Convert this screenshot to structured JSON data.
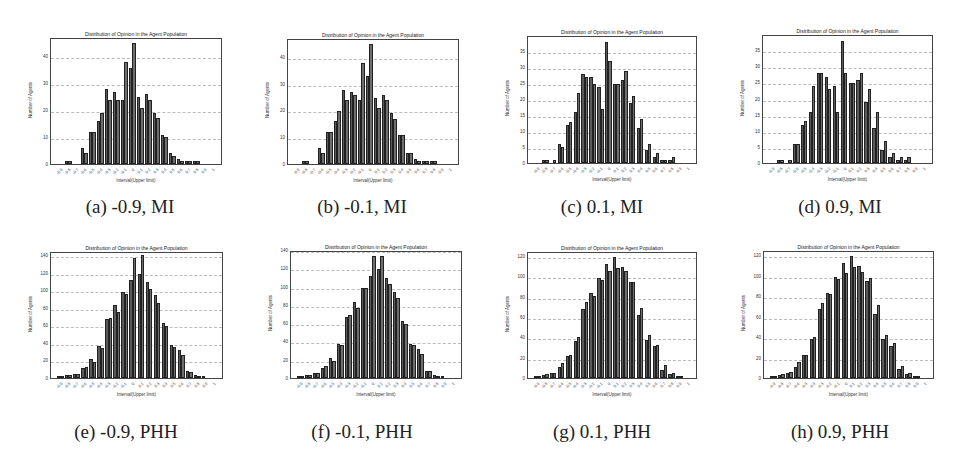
{
  "figure": {
    "captions": [
      "(a) -0.9, MI",
      "(b) -0.1, MI",
      "(c) 0.1, MI",
      "(d) 0.9, MI",
      "(e) -0.9, PHH",
      "(f) -0.1, PHH",
      "(g) 0.1, PHH",
      "(h) 0.9, PHH"
    ]
  },
  "chart_data": [
    {
      "id": "a",
      "type": "bar",
      "caption": "(a) -0.9, MI",
      "title": "Distribution of Opinion in the Agent Population",
      "xlabel": "Interval(Upper limit)",
      "ylabel": "Number of Agents",
      "ylim": [
        0,
        47
      ],
      "yticks": [
        0,
        10,
        20,
        30,
        40
      ],
      "grid": true,
      "categories": [
        "-0.9",
        "-0.8",
        "-0.7",
        "-0.6",
        "-0.5",
        "-0.4",
        "-0.3",
        "-0.2",
        "-0.1",
        "0",
        "0.1",
        "0.2",
        "0.3",
        "0.4",
        "0.5",
        "0.6",
        "0.7",
        "0.8",
        "0.9",
        "1"
      ],
      "series": [
        {
          "name": "series 1",
          "values": [
            0,
            1,
            0,
            6,
            12,
            16,
            28,
            27,
            24,
            36,
            25,
            26,
            19,
            11,
            4,
            2,
            1,
            1,
            0,
            0
          ]
        },
        {
          "name": "series 2",
          "values": [
            0,
            1,
            0,
            4,
            12,
            19,
            24,
            24,
            38,
            45,
            21,
            24,
            17,
            10,
            3,
            1,
            1,
            1,
            0,
            0
          ]
        }
      ]
    },
    {
      "id": "b",
      "type": "bar",
      "caption": "(b) -0.1, MI",
      "title": "Distribution of Opinion in the Agent Population",
      "xlabel": "Interval(Upper limit)",
      "ylabel": "Number of Agents",
      "ylim": [
        0,
        47
      ],
      "yticks": [
        0,
        10,
        20,
        30,
        40
      ],
      "grid": true,
      "categories": [
        "-0.9",
        "-0.8",
        "-0.7",
        "-0.6",
        "-0.5",
        "-0.4",
        "-0.3",
        "-0.2",
        "-0.1",
        "0",
        "0.1",
        "0.2",
        "0.3",
        "0.4",
        "0.5",
        "0.6",
        "0.7",
        "0.8",
        "0.9",
        "1"
      ],
      "series": [
        {
          "name": "series 1",
          "values": [
            0,
            1,
            0,
            6,
            12,
            16,
            28,
            27,
            24,
            33,
            25,
            26,
            19,
            11,
            4,
            2,
            1,
            1,
            0,
            0
          ]
        },
        {
          "name": "series 2",
          "values": [
            0,
            1,
            0,
            4,
            12,
            20,
            24,
            26,
            38,
            45,
            21,
            24,
            17,
            11,
            4,
            1,
            1,
            1,
            0,
            0
          ]
        }
      ]
    },
    {
      "id": "c",
      "type": "bar",
      "caption": "(c) 0.1, MI",
      "title": "Distribution of Opinion in the Agent Population",
      "xlabel": "Interval(Upper limit)",
      "ylabel": "Number of Agents",
      "ylim": [
        0,
        40
      ],
      "yticks": [
        0,
        5,
        10,
        15,
        20,
        25,
        30,
        35
      ],
      "grid": true,
      "categories": [
        "-0.9",
        "-0.8",
        "-0.7",
        "-0.6",
        "-0.5",
        "-0.4",
        "-0.3",
        "-0.2",
        "-0.1",
        "0",
        "0.1",
        "0.2",
        "0.3",
        "0.4",
        "0.5",
        "0.6",
        "0.7",
        "0.8",
        "0.9",
        "1"
      ],
      "series": [
        {
          "name": "series 1",
          "values": [
            0,
            1,
            0,
            6,
            12,
            16,
            28,
            27,
            24,
            38,
            25,
            26,
            19,
            11,
            4,
            2,
            1,
            1,
            0,
            0
          ]
        },
        {
          "name": "series 2",
          "values": [
            0,
            1,
            1,
            5,
            13,
            22,
            27,
            25,
            17,
            32,
            25,
            29,
            21,
            14,
            6,
            3,
            1,
            2,
            0,
            0
          ]
        }
      ]
    },
    {
      "id": "d",
      "type": "bar",
      "caption": "(d) 0.9, MI",
      "title": "Distribution of Opinion in the Agent Population",
      "xlabel": "Interval(Upper limit)",
      "ylabel": "Number of Agents",
      "ylim": [
        0,
        40
      ],
      "yticks": [
        0,
        5,
        10,
        15,
        20,
        25,
        30,
        35
      ],
      "grid": true,
      "categories": [
        "-0.9",
        "-0.8",
        "-0.7",
        "-0.6",
        "-0.5",
        "-0.4",
        "-0.3",
        "-0.2",
        "-0.1",
        "0",
        "0.1",
        "0.2",
        "0.3",
        "0.4",
        "0.5",
        "0.6",
        "0.7",
        "0.8",
        "0.9",
        "1"
      ],
      "series": [
        {
          "name": "series 1",
          "values": [
            0,
            1,
            0,
            6,
            12,
            16,
            28,
            27,
            24,
            38,
            25,
            26,
            19,
            11,
            4,
            2,
            1,
            1,
            0,
            0
          ]
        },
        {
          "name": "series 2",
          "values": [
            0,
            1,
            1,
            6,
            13,
            24,
            28,
            23,
            16,
            28,
            25,
            28,
            23,
            16,
            7,
            3,
            2,
            2,
            0,
            0
          ]
        }
      ]
    },
    {
      "id": "e",
      "type": "bar",
      "caption": "(e) -0.9, PHH",
      "title": "Distribution of Opinion in the Agent Population",
      "xlabel": "Interval(Upper limit)",
      "ylabel": "Number of Agents",
      "ylim": [
        0,
        145
      ],
      "yticks": [
        0,
        20,
        40,
        60,
        80,
        100,
        120,
        140
      ],
      "grid": true,
      "categories": [
        "-0.9",
        "-0.8",
        "-0.7",
        "-0.6",
        "-0.5",
        "-0.4",
        "-0.3",
        "-0.2",
        "-0.1",
        "0",
        "0.1",
        "0.2",
        "0.3",
        "0.4",
        "0.5",
        "0.6",
        "0.7",
        "0.8",
        "0.9",
        "1"
      ],
      "series": [
        {
          "name": "series 1",
          "values": [
            1,
            3,
            5,
            11,
            22,
            37,
            68,
            84,
            99,
            113,
            120,
            110,
            95,
            63,
            38,
            32,
            8,
            3,
            1,
            0
          ]
        },
        {
          "name": "series 2",
          "values": [
            1,
            3,
            5,
            13,
            19,
            35,
            69,
            76,
            97,
            138,
            141,
            103,
            86,
            60,
            36,
            26,
            7,
            2,
            0,
            0
          ]
        }
      ]
    },
    {
      "id": "f",
      "type": "bar",
      "caption": "(f) -0.1, PHH",
      "title": "Distribution of Opinion in the Agent Population",
      "xlabel": "Interval(Upper limit)",
      "ylabel": "Number of Agents",
      "ylim": [
        0,
        140
      ],
      "yticks": [
        0,
        20,
        40,
        60,
        80,
        100,
        120,
        140
      ],
      "grid": true,
      "categories": [
        "-0.9",
        "-0.8",
        "-0.7",
        "-0.6",
        "-0.5",
        "-0.4",
        "-0.3",
        "-0.2",
        "-0.1",
        "0",
        "0.1",
        "0.2",
        "0.3",
        "0.4",
        "0.5",
        "0.6",
        "0.7",
        "0.8",
        "0.9",
        "1"
      ],
      "series": [
        {
          "name": "series 1",
          "values": [
            1,
            3,
            5,
            11,
            22,
            37,
            67,
            84,
            99,
            113,
            120,
            110,
            95,
            63,
            38,
            32,
            8,
            3,
            1,
            0
          ]
        },
        {
          "name": "series 2",
          "values": [
            1,
            3,
            5,
            13,
            19,
            36,
            70,
            77,
            99,
            134,
            135,
            104,
            88,
            60,
            36,
            27,
            8,
            2,
            0,
            0
          ]
        }
      ]
    },
    {
      "id": "g",
      "type": "bar",
      "caption": "(g) 0.1, PHH",
      "title": "Distribution of Opinion in the Agent Population",
      "xlabel": "Interval(Upper limit)",
      "ylabel": "Number of Agents",
      "ylim": [
        0,
        125
      ],
      "yticks": [
        0,
        20,
        40,
        60,
        80,
        100,
        120
      ],
      "grid": true,
      "categories": [
        "-0.9",
        "-0.8",
        "-0.7",
        "-0.6",
        "-0.5",
        "-0.4",
        "-0.3",
        "-0.2",
        "-0.1",
        "0",
        "0.1",
        "0.2",
        "0.3",
        "0.4",
        "0.5",
        "0.6",
        "0.7",
        "0.8",
        "0.9",
        "1"
      ],
      "series": [
        {
          "name": "series 1",
          "values": [
            1,
            3,
            5,
            11,
            22,
            37,
            68,
            84,
            99,
            113,
            120,
            110,
            95,
            63,
            38,
            32,
            8,
            4,
            1,
            0
          ]
        },
        {
          "name": "series 2",
          "values": [
            1,
            4,
            5,
            15,
            23,
            41,
            75,
            81,
            97,
            106,
            109,
            106,
            95,
            69,
            43,
            33,
            13,
            5,
            1,
            0
          ]
        }
      ]
    },
    {
      "id": "h",
      "type": "bar",
      "caption": "(h) 0.9, PHH",
      "title": "Distribution of Opinion in the Agent Population",
      "xlabel": "Interval(Upper limit)",
      "ylabel": "Number of Agents",
      "ylim": [
        0,
        125
      ],
      "yticks": [
        0,
        20,
        40,
        60,
        80,
        100,
        120
      ],
      "grid": true,
      "categories": [
        "-0.9",
        "-0.8",
        "-0.7",
        "-0.6",
        "-0.5",
        "-0.4",
        "-0.3",
        "-0.2",
        "-0.1",
        "0",
        "0.1",
        "0.2",
        "0.3",
        "0.4",
        "0.5",
        "0.6",
        "0.7",
        "0.8",
        "0.9",
        "1"
      ],
      "series": [
        {
          "name": "series 1",
          "values": [
            1,
            3,
            5,
            11,
            23,
            38,
            68,
            84,
            99,
            113,
            120,
            110,
            95,
            63,
            38,
            32,
            9,
            4,
            1,
            0
          ]
        },
        {
          "name": "series 2",
          "values": [
            1,
            4,
            6,
            16,
            23,
            40,
            74,
            83,
            97,
            103,
            109,
            104,
            98,
            72,
            42,
            34,
            12,
            5,
            1,
            0
          ]
        }
      ]
    }
  ]
}
